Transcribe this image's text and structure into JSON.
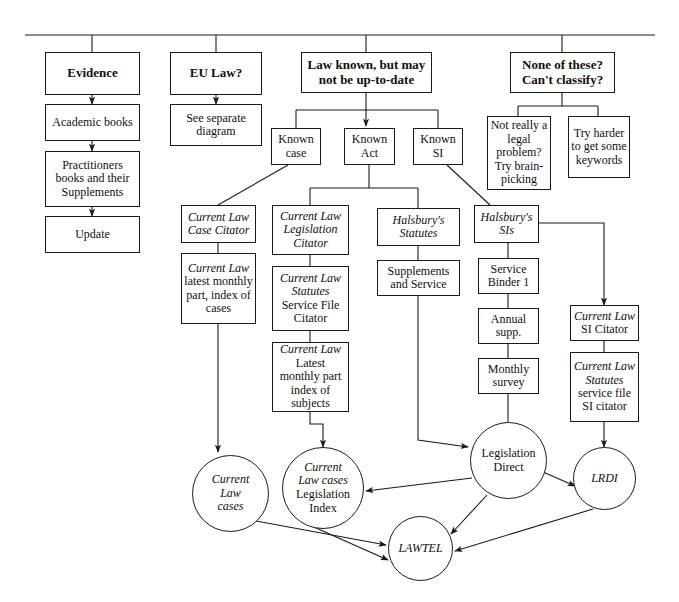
{
  "diagram": {
    "stroke_color": "#1a1a1a",
    "background_color": "#ffffff"
  },
  "nodes": {
    "evidence": "Evidence",
    "academic_books": "Academic books",
    "practitioners_books": "Practitioners books and their Supplements",
    "update": "Update",
    "eu_law": "EU Law?",
    "see_separate_diagram": "See separate diagram",
    "law_known": "Law known, but may not be up-to-date",
    "none_of_these": "None of these? Can't classify?",
    "known_case": "Known case",
    "known_act": "Known Act",
    "known_si": "Known SI",
    "not_really_legal": "Not really a legal problem? Try brain-picking",
    "try_harder": "Try harder to get some keywords",
    "cl_case_citator_1": "Current Law",
    "cl_case_citator_2": "Case Citator",
    "cl_latest_monthly_1": "Current Law",
    "cl_latest_monthly_2": "latest monthly part, index of cases",
    "cl_legislation_citator_1": "Current Law",
    "cl_legislation_citator_2": "Legislation Citator",
    "cl_statutes_service_1": "Current Law Statutes",
    "cl_statutes_service_2": "Service File Citator",
    "cl_latest_subjects_1": "Current Law",
    "cl_latest_subjects_2": "Latest monthly part index of subjects",
    "halsburys_statutes_1": "Halsbury's",
    "halsburys_statutes_2": "Statutes",
    "supplements_and_service": "Supplements and Service",
    "halsburys_sis": "Halsbury's SIs",
    "service_binder_1": "Service Binder 1",
    "annual_supp": "Annual supp.",
    "monthly_survey": "Monthly survey",
    "cl_si_citator_1": "Current Law",
    "cl_si_citator_2": "SI Citator",
    "cl_statutes_si_1": "Current Law Statutes",
    "cl_statutes_si_2": "service file SI citator"
  },
  "ellipses": {
    "current_law_cases_1": "Current",
    "current_law_cases_2": "Law",
    "current_law_cases_3": "cases",
    "cl_cases_legislation_index_1": "Current",
    "cl_cases_legislation_index_2": "Law cases",
    "cl_cases_legislation_index_3": "Legislation",
    "cl_cases_legislation_index_4": "Index",
    "legislation_direct_1": "Legislation",
    "legislation_direct_2": "Direct",
    "lrdi": "LRDI",
    "lawtel": "LAWTEL"
  }
}
